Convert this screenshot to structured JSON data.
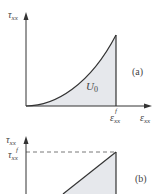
{
  "figure": {
    "panel_a": {
      "y_axis_label": "τ",
      "y_axis_sub": "xx",
      "x_axis_label": "ε",
      "x_axis_sub": "xx",
      "x_tick_label": "ε",
      "x_tick_sub": "xx",
      "x_tick_sup": "f",
      "area_label": "U",
      "area_sub": "0",
      "panel_tag": "(a)",
      "curve": "nonlinear convex stress-strain curve, area under curve shaded"
    },
    "panel_b": {
      "y_axis_label": "τ",
      "y_axis_sub": "xx",
      "y_tick_label": "τ",
      "y_tick_sub": "xx",
      "y_tick_sup": "f",
      "panel_tag": "(b)",
      "curve": "linear stress-strain line with dashed reference at failure stress, area shaded"
    },
    "colors": {
      "line": "#333333",
      "fill": "#e6e8ec",
      "text": "#444444"
    }
  }
}
